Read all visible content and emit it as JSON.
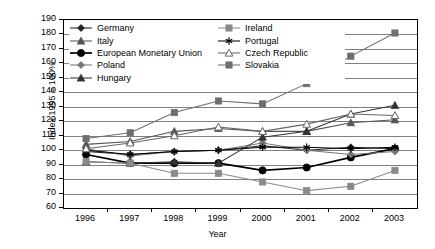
{
  "chart_data": {
    "type": "line",
    "title": "",
    "xlabel": "Year",
    "ylabel": "Index 1995 = 100%",
    "categories": [
      "1996",
      "1997",
      "1998",
      "1999",
      "2000",
      "2001",
      "2002",
      "2003"
    ],
    "ylim": [
      60,
      190
    ],
    "ytick_step": 10,
    "yticks": [
      60,
      70,
      80,
      90,
      100,
      110,
      120,
      130,
      140,
      150,
      160,
      170,
      180,
      190
    ],
    "grid": "horizontal",
    "legend_position": "inside-top-left",
    "series": [
      {
        "name": "Germany",
        "marker": "diamond",
        "marker_fill": "#222222",
        "color": "#222222",
        "values": [
          99,
          97,
          99,
          100,
          103,
          100,
          102,
          101
        ]
      },
      {
        "name": "Italy",
        "marker": "triangle",
        "marker_fill": "#555555",
        "color": "#555555",
        "values": [
          104,
          106,
          113,
          115,
          113,
          113,
          119,
          121
        ]
      },
      {
        "name": "European Monetary Union",
        "marker": "circle",
        "marker_fill": "#000000",
        "color": "#000000",
        "values": [
          97,
          91,
          91,
          91,
          86,
          88,
          95,
          101
        ]
      },
      {
        "name": "Poland",
        "marker": "diamond",
        "marker_fill": "#777777",
        "color": "#777777",
        "values": [
          101,
          96,
          99,
          100,
          105,
          100,
          97,
          99
        ]
      },
      {
        "name": "Hungary",
        "marker": "triangle",
        "marker_fill": "#333333",
        "color": "#333333",
        "values": [
          92,
          91,
          92,
          91,
          109,
          113,
          125,
          131
        ]
      },
      {
        "name": "Ireland",
        "marker": "square",
        "marker_fill": "#8a8a8a",
        "color": "#8a8a8a",
        "values": [
          92,
          91,
          84,
          84,
          78,
          72,
          75,
          86
        ]
      },
      {
        "name": "Portugal",
        "marker": "star",
        "marker_fill": "#000000",
        "color": "#000000",
        "values": [
          100,
          97,
          99,
          100,
          102,
          102,
          101,
          102
        ]
      },
      {
        "name": "Czech Republic",
        "marker": "triangle-open",
        "marker_fill": "#ffffff",
        "color": "#666666",
        "values": [
          101,
          105,
          110,
          116,
          113,
          118,
          125,
          124
        ]
      },
      {
        "name": "Slovakia",
        "marker": "square",
        "marker_fill": "#6e6e6e",
        "color": "#6e6e6e",
        "values": [
          108,
          112,
          126,
          134,
          132,
          146,
          165,
          181
        ]
      }
    ]
  },
  "colors": {
    "axis": "#000000",
    "grid": "#808080",
    "background": "#ffffff"
  }
}
